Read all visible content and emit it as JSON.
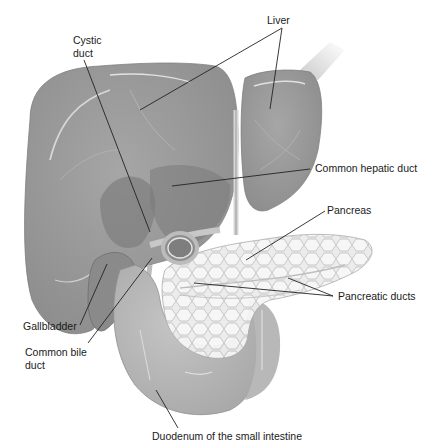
{
  "figure": {
    "type": "anatomical-illustration",
    "colors": {
      "background": "#ffffff",
      "liver": "#9a9a9a",
      "liver_dark": "#7e7e7e",
      "gallbladder": "#8a8a8a",
      "pancreas": "#e6e6e6",
      "duodenum": "#b4b4b4",
      "leader_line": "#222222",
      "label_text": "#1a1a1a"
    }
  },
  "labels": {
    "liver": "Liver",
    "cystic_duct": "Cystic\nduct",
    "common_hepatic_duct": "Common hepatic duct",
    "pancreas": "Pancreas",
    "pancreatic_ducts": "Pancreatic ducts",
    "gallbladder": "Gallbladder",
    "common_bile_duct": "Common bile\nduct",
    "duodenum": "Duodenum of the small intestine"
  }
}
